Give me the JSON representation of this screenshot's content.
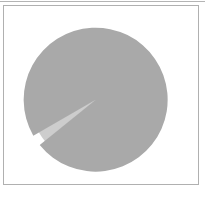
{
  "figure": {
    "title": "",
    "background_color": "#ffffff",
    "frame_color": "#b0b0b0",
    "width_px": 206,
    "height_px": 198
  },
  "chart_data": {
    "type": "pie",
    "title": "",
    "subtitle": "",
    "xlabel": "",
    "ylabel": "",
    "grid": false,
    "legend": "none",
    "labels_shown": false,
    "percent_labels_shown": false,
    "center": {
      "x": 101,
      "y": 96
    },
    "radius": 72,
    "start_angle_deg": 90,
    "direction": "counterclockwise",
    "slices": [
      {
        "name": "major-slice",
        "label": "",
        "value": 97.5,
        "percent": 97.5,
        "color": "#cdcdcd",
        "exploded": false,
        "explode_offset": 0.0,
        "start_angle_deg": 219,
        "end_angle_deg": 570
      },
      {
        "name": "minor-slice",
        "label": "",
        "value": 2.5,
        "percent": 2.5,
        "color": "#a9a9a9",
        "exploded": true,
        "explode_offset": 0.09,
        "start_angle_deg": 210,
        "end_angle_deg": 219
      }
    ],
    "total": 100
  }
}
